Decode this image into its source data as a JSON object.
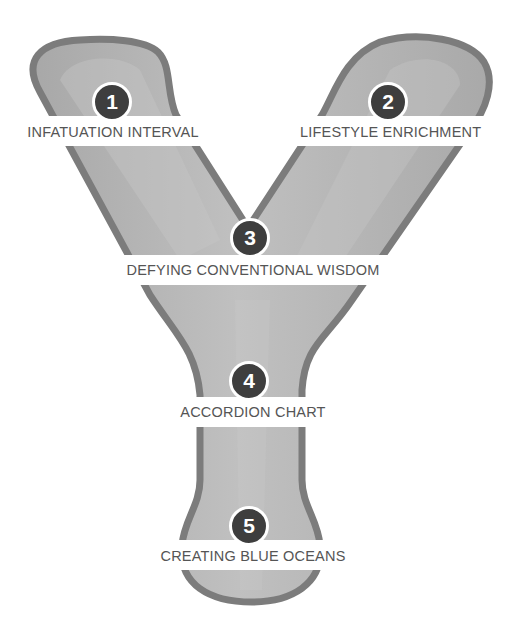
{
  "diagram": {
    "shape": "letter-Y",
    "colors": {
      "fill": "#b0b0b0",
      "fill_light": "#c4c4c4",
      "outline": "#7a7a7a",
      "badge": "#3e3e3e",
      "label_text": "#555555",
      "background": "#ffffff"
    },
    "steps": [
      {
        "number": "1",
        "label": "INFATUATION INTERVAL"
      },
      {
        "number": "2",
        "label": "LIFESTYLE ENRICHMENT"
      },
      {
        "number": "3",
        "label": "DEFYING CONVENTIONAL WISDOM"
      },
      {
        "number": "4",
        "label": "ACCORDION CHART"
      },
      {
        "number": "5",
        "label": "CREATING BLUE OCEANS"
      }
    ]
  }
}
